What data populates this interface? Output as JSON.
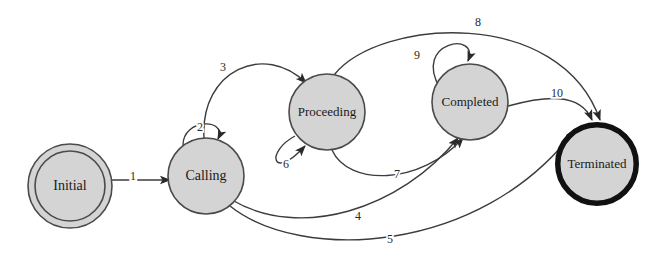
{
  "diagram": {
    "background_color": "#ffffff",
    "node_fill_color": "#d4d4d4",
    "node_stroke_color": "#4a4a4a",
    "edge_color": "#3c3c3c",
    "text_color": "#1a1a1a",
    "states": [
      {
        "id": "initial",
        "label": "Initial",
        "shape": "double-circle",
        "cx": 70,
        "cy": 186,
        "r": 42,
        "inner_r": 35,
        "stroke_width": 1.6,
        "font_size": 14
      },
      {
        "id": "calling",
        "label": "Calling",
        "shape": "circle",
        "cx": 206,
        "cy": 176,
        "r": 38,
        "stroke_width": 1.6,
        "font_size": 14
      },
      {
        "id": "proceeding",
        "label": "Proceeding",
        "shape": "circle",
        "cx": 327,
        "cy": 112,
        "r": 38,
        "stroke_width": 1.6,
        "font_size": 13
      },
      {
        "id": "completed",
        "label": "Completed",
        "shape": "circle",
        "cx": 470,
        "cy": 102,
        "r": 38,
        "stroke_width": 1.6,
        "font_size": 13
      },
      {
        "id": "terminated",
        "label": "Terminated",
        "shape": "thick-circle",
        "cx": 597,
        "cy": 164,
        "r": 42,
        "stroke_width": 5.5,
        "font_size": 13
      }
    ],
    "transitions": [
      {
        "id": "t1",
        "label": "1",
        "from": "initial",
        "to": "calling",
        "label_x": 133,
        "label_y": 177,
        "path": "M 112 180 L 170 180"
      },
      {
        "id": "t2",
        "label": "2",
        "from": "calling",
        "to": "calling",
        "label_x": 200,
        "label_y": 128,
        "path": "M 183 145 C 183 118, 228 118, 218 139"
      },
      {
        "id": "t3",
        "label": "3",
        "from": "calling",
        "to": "proceeding",
        "label_x": 223,
        "label_y": 68,
        "path": "M 204 138 C 200 70, 265 42, 306 83"
      },
      {
        "id": "t4",
        "label": "4",
        "from": "calling",
        "to": "completed",
        "label_x": 358,
        "label_y": 217,
        "path": "M 232 200 C 300 240, 400 210, 458 138"
      },
      {
        "id": "t5",
        "label": "5",
        "from": "calling",
        "to": "terminated",
        "label_x": 390,
        "label_y": 240,
        "path": "M 230 206 C 300 262, 480 256, 575 130"
      },
      {
        "id": "t6",
        "label": "6",
        "from": "proceeding",
        "to": "proceeding",
        "label_x": 286,
        "label_y": 165,
        "path": "M 295 136 C 265 152, 272 182, 305 146"
      },
      {
        "id": "t7",
        "label": "7",
        "from": "proceeding",
        "to": "completed",
        "label_x": 397,
        "label_y": 175,
        "path": "M 332 150 C 348 186, 420 186, 463 138"
      },
      {
        "id": "t8",
        "label": "8",
        "from": "proceeding",
        "to": "terminated",
        "label_x": 478,
        "label_y": 23,
        "path": "M 334 75 C 380 18, 560 6, 600 120"
      },
      {
        "id": "t9",
        "label": "9",
        "from": "completed",
        "to": "completed",
        "label_x": 417,
        "label_y": 56,
        "path": "M 440 88 C 412 42, 480 30, 468 61"
      },
      {
        "id": "t10",
        "label": "10",
        "from": "completed",
        "to": "terminated",
        "label_x": 557,
        "label_y": 94,
        "path": "M 508 106 C 545 96, 580 92, 592 120"
      }
    ]
  }
}
